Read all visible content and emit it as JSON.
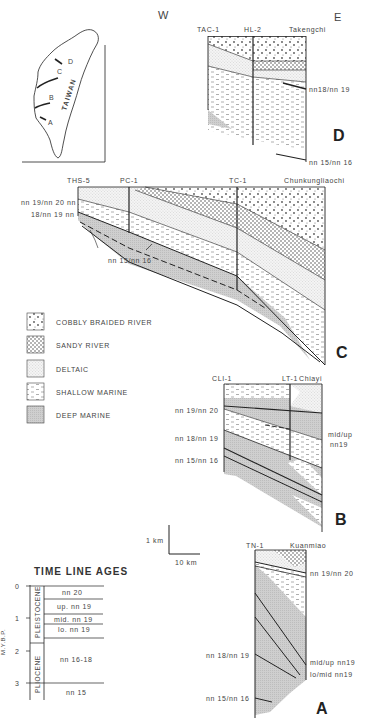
{
  "compass": {
    "west": "W",
    "east": "E"
  },
  "map": {
    "label": "TAIWAN",
    "section_markers": [
      "A",
      "B",
      "C",
      "D"
    ]
  },
  "sections": {
    "D": {
      "letter": "D",
      "wells": [
        "TAC-1",
        "HL-2",
        "Takengchi"
      ],
      "labels": [
        "nn18/nn 19",
        "nn 15/nn 16"
      ]
    },
    "C": {
      "letter": "C",
      "wells": [
        "THS-5",
        "PC-1",
        "TC-1",
        "Chunkungliaochi"
      ],
      "labels": [
        "nn 19/nn 20 nn",
        "18/nn 19 nn",
        "nn 15/nn 16"
      ]
    },
    "B": {
      "letter": "B",
      "wells": [
        "CLI-1",
        "LT-1",
        "Chiayi"
      ],
      "labels_left": [
        "nn 19/nn 20",
        "nn 18/nn 19",
        "nn 15/nn 16"
      ],
      "labels_right": [
        "mid/up",
        "nn19"
      ]
    },
    "A": {
      "letter": "A",
      "wells": [
        "TN-1",
        "Kuanmiao"
      ],
      "labels_left": [
        "nn 18/nn 19",
        "nn 15/nn 16"
      ],
      "labels_right": [
        "nn 19/nn 20",
        "mid/up nn19",
        "lo/mid nn19"
      ]
    }
  },
  "legend": {
    "items": [
      {
        "label": "COBBLY BRAIDED RIVER",
        "pattern": "cobbly"
      },
      {
        "label": "SANDY RIVER",
        "pattern": "sandy"
      },
      {
        "label": "DELTAIC",
        "pattern": "deltaic"
      },
      {
        "label": "SHALLOW MARINE",
        "pattern": "shallow"
      },
      {
        "label": "DEEP MARINE",
        "pattern": "deep"
      }
    ]
  },
  "scale_bar": {
    "vertical": "1 km",
    "horizontal": "10 km"
  },
  "time_line_ages": {
    "title": "TIME LINE AGES",
    "axis_label": "M.Y.B.P.",
    "ticks": [
      "0",
      "1",
      "2",
      "3"
    ],
    "epochs": [
      "PLEISTOCENE",
      "PLIOCENE"
    ],
    "zones": [
      "nn 20",
      "up. nn 19",
      "mid. nn 19",
      "lo. nn 19",
      "nn 16-18",
      "nn 15"
    ]
  },
  "colors": {
    "ink": "#222222",
    "deep_marine": "#c8c8c8",
    "background": "#ffffff"
  }
}
